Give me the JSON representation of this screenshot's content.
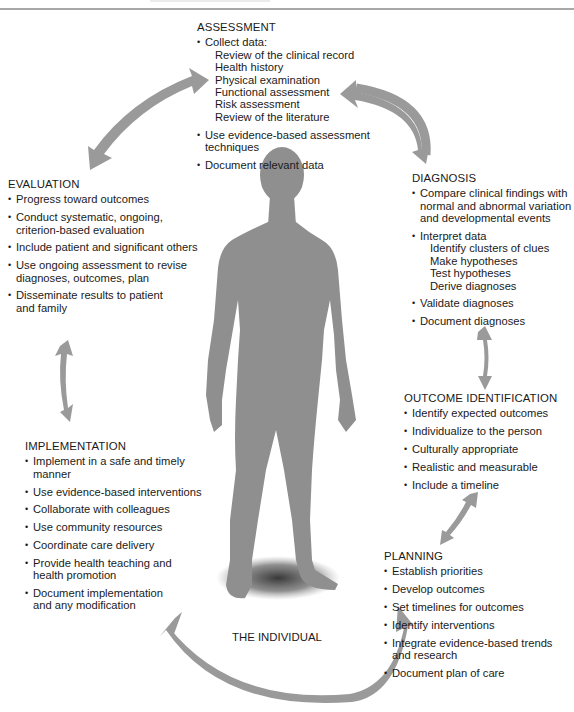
{
  "colors": {
    "figure": "#8f8f8f",
    "arrow": "#9a9a9a",
    "text": "#1a1a1a",
    "rule": "#a8a8a8"
  },
  "center_label": "THE INDIVIDUAL",
  "assessment": {
    "title": "ASSESSMENT",
    "items": [
      {
        "text": "Collect data:",
        "subitems": [
          "Review of the clinical record",
          "Health history",
          "Physical examination",
          "Functional assessment",
          "Risk assessment",
          "Review of the literature"
        ]
      },
      {
        "text": "Use evidence-based assessment techniques"
      },
      {
        "text": "Document relevant data"
      }
    ]
  },
  "diagnosis": {
    "title": "DIAGNOSIS",
    "items": [
      {
        "text": "Compare clinical findings with normal and abnormal variation and developmental events"
      },
      {
        "text": "Interpret data",
        "subitems": [
          "Identify clusters of clues",
          "Make hypotheses",
          "Test hypotheses",
          "Derive diagnoses"
        ]
      },
      {
        "text": "Validate diagnoses"
      },
      {
        "text": "Document diagnoses"
      }
    ]
  },
  "outcome_identification": {
    "title": "OUTCOME IDENTIFICATION",
    "items": [
      {
        "text": "Identify expected outcomes"
      },
      {
        "text": "Individualize to the person"
      },
      {
        "text": "Culturally appropriate"
      },
      {
        "text": "Realistic and measurable"
      },
      {
        "text": "Include a timeline"
      }
    ]
  },
  "planning": {
    "title": "PLANNING",
    "items": [
      {
        "text": "Establish priorities"
      },
      {
        "text": "Develop outcomes"
      },
      {
        "text": "Set timelines for outcomes"
      },
      {
        "text": "Identify interventions"
      },
      {
        "text": "Integrate evidence-based trends and research"
      },
      {
        "text": "Document plan of care"
      }
    ]
  },
  "implementation": {
    "title": "IMPLEMENTATION",
    "items": [
      {
        "text": "Implement in a safe and timely manner"
      },
      {
        "text": "Use evidence-based interventions"
      },
      {
        "text": "Collaborate with colleagues"
      },
      {
        "text": "Use community resources"
      },
      {
        "text": "Coordinate care delivery"
      },
      {
        "text": "Provide health teaching and health promotion"
      },
      {
        "text": "Document implementation and any modification"
      }
    ]
  },
  "evaluation": {
    "title": "EVALUATION",
    "items": [
      {
        "text": "Progress toward outcomes"
      },
      {
        "text": "Conduct systematic, ongoing, criterion-based evaluation"
      },
      {
        "text": "Include patient and significant others"
      },
      {
        "text": "Use ongoing assessment to revise diagnoses, outcomes, plan"
      },
      {
        "text": "Disseminate results to patient and family"
      }
    ]
  }
}
